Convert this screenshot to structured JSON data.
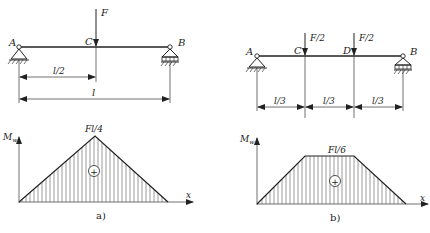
{
  "diagram_a": {
    "caption": "a)",
    "points": {
      "A": "A",
      "B": "B",
      "C": "C"
    },
    "force": "F",
    "dimensions": {
      "half": "l/2",
      "full": "l"
    },
    "moment_axis": {
      "y_label": "M",
      "y_sub": "w",
      "x_label": "x"
    },
    "peak_label": "Fl/4",
    "sign": "+"
  },
  "diagram_b": {
    "caption": "b)",
    "points": {
      "A": "A",
      "B": "B",
      "C": "C",
      "D": "D"
    },
    "forces": [
      "F/2",
      "F/2"
    ],
    "dimensions": [
      "l/3",
      "l/3",
      "l/3"
    ],
    "moment_axis": {
      "y_label": "M",
      "y_sub": "w",
      "x_label": "x"
    },
    "peak_label": "Fl/6",
    "sign": "+"
  },
  "colors": {
    "line": "#222222",
    "hatch": "#555555",
    "background": "#ffffff"
  }
}
